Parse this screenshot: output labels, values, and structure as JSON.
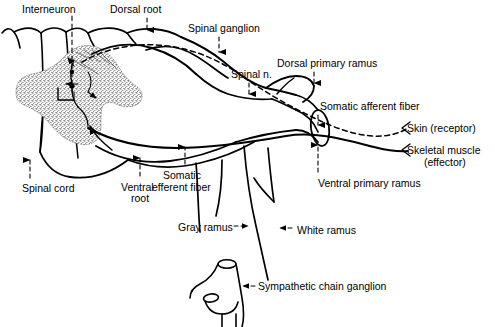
{
  "figure": {
    "type": "anatomical-line-diagram",
    "width": 495,
    "height": 327,
    "background_color": "#ffffff",
    "line_color": "#000000"
  },
  "labels": [
    {
      "id": "interneuron",
      "text": "Interneuron",
      "x": 22,
      "y": 4,
      "leader": "dashed-vertical-down"
    },
    {
      "id": "dorsal-root",
      "text": "Dorsal root",
      "x": 110,
      "y": 4,
      "leader": "dashed-arrow-down"
    },
    {
      "id": "spinal-ganglion",
      "text": "Spinal ganglion",
      "x": 188,
      "y": 23,
      "leader": "dashed-arrow-down"
    },
    {
      "id": "dorsal-primary-ramus",
      "text": "Dorsal primary ramus",
      "x": 277,
      "y": 58,
      "leader": "dashed-arrow-down"
    },
    {
      "id": "spinal-n",
      "text": "Spinal n.",
      "x": 231,
      "y": 69,
      "leader": "dashed-arrow-down"
    },
    {
      "id": "somatic-afferent-fiber",
      "text": "Somatic afferent fiber",
      "x": 320,
      "y": 101,
      "leader": "dashed-arrow-down"
    },
    {
      "id": "skin-receptor",
      "text": "Skin (receptor)",
      "x": 407,
      "y": 123,
      "leader": "arrowhead-left"
    },
    {
      "id": "skeletal-muscle",
      "text": "Skeletal muscle",
      "x": 407,
      "y": 145,
      "leader": "arrowhead-left"
    },
    {
      "id": "skeletal-muscle-effector",
      "text": "(effector)",
      "x": 424,
      "y": 157,
      "leader": "none"
    },
    {
      "id": "ventral-primary-ramus",
      "text": "Ventral primary ramus",
      "x": 318,
      "y": 178,
      "leader": "dashed-arrow-up"
    },
    {
      "id": "spinal-cord",
      "text": "Spinal cord",
      "x": 22,
      "y": 183,
      "leader": "dashed-arrow-up"
    },
    {
      "id": "ventral-root",
      "text": "Ventral",
      "x": 121,
      "y": 182,
      "leader": "dashed-arrow-up"
    },
    {
      "id": "ventral-root-2",
      "text": "root",
      "x": 131,
      "y": 193,
      "leader": "none"
    },
    {
      "id": "somatic-efferent-fiber",
      "text": "Somatic",
      "x": 163,
      "y": 170,
      "leader": "dashed-arrow-up"
    },
    {
      "id": "somatic-efferent-fiber-2",
      "text": "efferent fiber",
      "x": 152,
      "y": 182,
      "leader": "none"
    },
    {
      "id": "gray-ramus",
      "text": "Gray ramus",
      "x": 178,
      "y": 222,
      "leader": "dashed-arrow-right"
    },
    {
      "id": "white-ramus",
      "text": "White ramus",
      "x": 297,
      "y": 225,
      "leader": "dashed-arrow-left"
    },
    {
      "id": "sympathetic-chain-ganglion",
      "text": "Sympathetic chain ganglion",
      "x": 258,
      "y": 281,
      "leader": "dashed-arrow-left"
    }
  ],
  "structures": [
    {
      "id": "spinal-cord-outline",
      "name": "spinal cord white matter outline"
    },
    {
      "id": "gray-matter",
      "name": "stippled gray matter (butterfly horn)"
    },
    {
      "id": "dorsal-root-band",
      "name": "dorsal root"
    },
    {
      "id": "spinal-ganglion-body",
      "name": "spinal (dorsal root) ganglion"
    },
    {
      "id": "ventral-root-band",
      "name": "ventral root"
    },
    {
      "id": "spinal-nerve-trunk",
      "name": "spinal nerve trunk"
    },
    {
      "id": "dorsal-primary-ramus-branch",
      "name": "dorsal primary ramus"
    },
    {
      "id": "ventral-primary-ramus-branch",
      "name": "ventral primary ramus (cut cylinder)"
    },
    {
      "id": "afferent-fiber-path",
      "name": "somatic afferent fiber (dashed) to skin receptor"
    },
    {
      "id": "efferent-fiber-path",
      "name": "somatic efferent fiber (solid) to skeletal muscle"
    },
    {
      "id": "gray-ramus-branch",
      "name": "gray ramus communicans"
    },
    {
      "id": "white-ramus-branch",
      "name": "white ramus communicans"
    },
    {
      "id": "sympathetic-chain",
      "name": "sympathetic chain ganglion"
    }
  ]
}
